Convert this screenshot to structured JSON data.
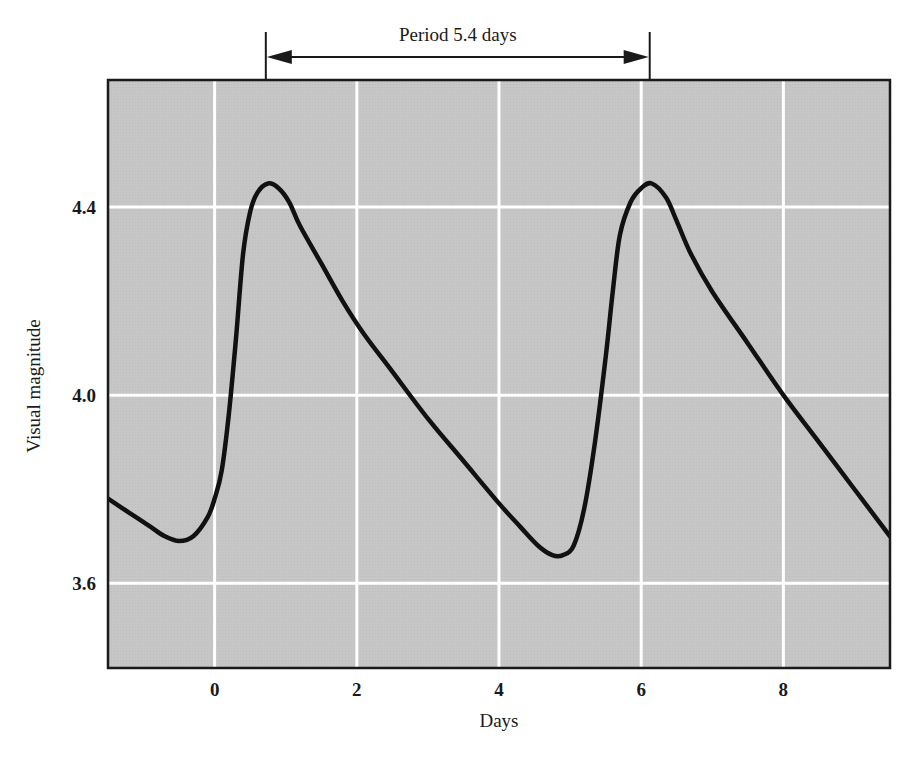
{
  "chart_data": {
    "type": "line",
    "title": "",
    "xlabel": "Days",
    "ylabel": "Visual magnitude",
    "xlim": [
      -1.5,
      9.5
    ],
    "ylim": [
      3.42,
      4.67
    ],
    "x_ticks": [
      0,
      2,
      4,
      6,
      8
    ],
    "x_tick_labels": [
      "0",
      "2",
      "4",
      "6",
      "8"
    ],
    "y_ticks": [
      3.6,
      4.0,
      4.4
    ],
    "y_tick_labels": [
      "3.6",
      "4.0",
      "4.4"
    ],
    "grid": true,
    "legend": null,
    "colors": {
      "plot_background": "#c4c4c4",
      "grid": "#ffffff",
      "line": "#111111",
      "frame": "#1a1a1a"
    },
    "annotations": [
      {
        "type": "period-bracket",
        "text": "Period  5.4 days",
        "x_start": 0.72,
        "x_end": 6.12
      }
    ],
    "series": [
      {
        "name": "Light curve",
        "x": [
          -1.5,
          -1.2,
          -0.9,
          -0.7,
          -0.5,
          -0.3,
          -0.1,
          0.0,
          0.1,
          0.2,
          0.3,
          0.4,
          0.5,
          0.6,
          0.75,
          0.9,
          1.05,
          1.2,
          1.5,
          1.8,
          2.1,
          2.5,
          3.0,
          3.5,
          4.0,
          4.3,
          4.55,
          4.75,
          4.9,
          5.05,
          5.2,
          5.35,
          5.5,
          5.6,
          5.7,
          5.85,
          6.0,
          6.15,
          6.35,
          6.5,
          6.7,
          7.0,
          7.5,
          8.0,
          8.5,
          9.0,
          9.5
        ],
        "y": [
          3.78,
          3.75,
          3.72,
          3.7,
          3.69,
          3.7,
          3.74,
          3.78,
          3.84,
          3.96,
          4.12,
          4.3,
          4.39,
          4.43,
          4.45,
          4.44,
          4.41,
          4.36,
          4.28,
          4.2,
          4.13,
          4.05,
          3.95,
          3.86,
          3.77,
          3.72,
          3.68,
          3.66,
          3.66,
          3.68,
          3.76,
          3.9,
          4.08,
          4.22,
          4.34,
          4.41,
          4.44,
          4.45,
          4.42,
          4.37,
          4.3,
          4.22,
          4.11,
          4.0,
          3.9,
          3.8,
          3.7
        ]
      }
    ]
  }
}
